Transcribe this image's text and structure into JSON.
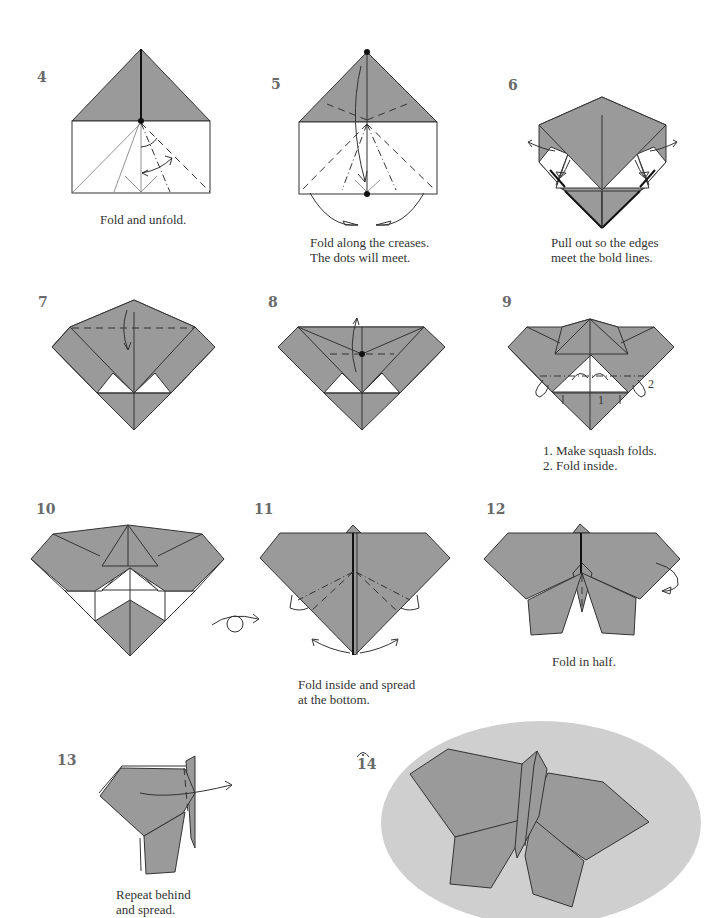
{
  "colors": {
    "paper_gray": "#9a9a9a",
    "ellipse_bg": "#cfcfcf",
    "outline": "#333333",
    "step_number": "#6a6a6a"
  },
  "steps": [
    {
      "number": "4",
      "caption_lines": [
        "Fold and unfold."
      ]
    },
    {
      "number": "5",
      "caption_lines": [
        "Fold along the creases.",
        "The dots will meet."
      ]
    },
    {
      "number": "6",
      "caption_lines": [
        "Pull out so the edges",
        "meet the bold lines."
      ]
    },
    {
      "number": "7",
      "caption_lines": []
    },
    {
      "number": "8",
      "caption_lines": []
    },
    {
      "number": "9",
      "caption_lines": [
        "1. Make squash folds.",
        "2. Fold inside."
      ],
      "labels": [
        "1",
        "2"
      ]
    },
    {
      "number": "10",
      "caption_lines": []
    },
    {
      "number": "11",
      "caption_lines": [
        "Fold inside and spread",
        "at the bottom."
      ]
    },
    {
      "number": "12",
      "caption_lines": [
        "Fold in half."
      ]
    },
    {
      "number": "13",
      "caption_lines": [
        "Repeat behind",
        "and spread."
      ]
    },
    {
      "number": "14",
      "caption_lines": [],
      "symbol": "finished-model-icon"
    }
  ],
  "symbols": {
    "turn_over": "turn-over-icon"
  }
}
